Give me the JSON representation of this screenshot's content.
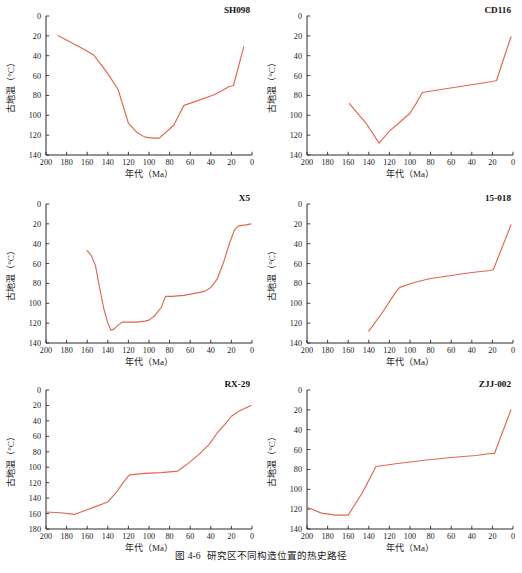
{
  "figure": {
    "caption_number": "图 4-6",
    "caption_text": "研究区不同构造位置的热史路径",
    "line_color": "#e2664f",
    "axis_color": "#2b2b2b"
  },
  "axes": {
    "xlabel": "年代（Ma）",
    "ylabel": "古地温（°C）",
    "x_ticks": [
      200,
      180,
      160,
      140,
      120,
      100,
      80,
      60,
      40,
      20,
      0
    ],
    "y_ticks_140": [
      0,
      20,
      40,
      60,
      80,
      100,
      120,
      140
    ],
    "y_ticks_180": [
      0,
      20,
      40,
      60,
      80,
      100,
      120,
      140,
      160,
      180
    ]
  },
  "chart_data": [
    {
      "type": "line",
      "title": "SH098",
      "xlabel": "年代（Ma）",
      "ylabel": "古地温（°C）",
      "xlim": [
        200,
        0
      ],
      "ylim": [
        140,
        0
      ],
      "y_inverted": true,
      "grid": false,
      "legend": "none",
      "series": [
        {
          "name": "SH098",
          "points": [
            [
              188,
              20
            ],
            [
              166,
              32
            ],
            [
              154,
              39
            ],
            [
              148,
              47
            ],
            [
              140,
              58
            ],
            [
              130,
              74
            ],
            [
              120,
              108
            ],
            [
              112,
              117
            ],
            [
              104,
              122
            ],
            [
              96,
              123
            ],
            [
              90,
              123
            ],
            [
              76,
              110
            ],
            [
              66,
              90
            ],
            [
              52,
              85
            ],
            [
              36,
              79
            ],
            [
              22,
              71
            ],
            [
              18,
              70
            ],
            [
              8,
              31
            ]
          ]
        }
      ]
    },
    {
      "type": "line",
      "title": "CD116",
      "xlabel": "年代（Ma）",
      "ylabel": "古地温（°C）",
      "xlim": [
        200,
        0
      ],
      "ylim": [
        140,
        0
      ],
      "y_inverted": true,
      "grid": false,
      "legend": "none",
      "series": [
        {
          "name": "CD116",
          "points": [
            [
              159,
              88
            ],
            [
              142,
              109
            ],
            [
              130,
              128
            ],
            [
              120,
              116
            ],
            [
              110,
              107
            ],
            [
              100,
              98
            ],
            [
              94,
              88
            ],
            [
              88,
              77
            ],
            [
              70,
              74
            ],
            [
              45,
              70
            ],
            [
              20,
              66
            ],
            [
              16,
              65
            ],
            [
              2,
              21
            ]
          ]
        }
      ]
    },
    {
      "type": "line",
      "title": "X5",
      "xlabel": "年代（Ma）",
      "ylabel": "古地温（°C）",
      "xlim": [
        200,
        0
      ],
      "ylim": [
        140,
        0
      ],
      "y_inverted": true,
      "grid": false,
      "legend": "none",
      "series": [
        {
          "name": "X5",
          "points": [
            [
              160,
              47
            ],
            [
              156,
              52
            ],
            [
              152,
              62
            ],
            [
              148,
              84
            ],
            [
              144,
              105
            ],
            [
              140,
              120
            ],
            [
              137,
              127
            ],
            [
              134,
              126
            ],
            [
              130,
              122
            ],
            [
              126,
              119
            ],
            [
              120,
              119
            ],
            [
              112,
              119
            ],
            [
              104,
              118
            ],
            [
              100,
              117
            ],
            [
              94,
              112
            ],
            [
              88,
              104
            ],
            [
              84,
              93
            ],
            [
              78,
              93
            ],
            [
              66,
              92
            ],
            [
              56,
              90
            ],
            [
              46,
              88
            ],
            [
              40,
              84
            ],
            [
              34,
              76
            ],
            [
              28,
              60
            ],
            [
              22,
              40
            ],
            [
              17,
              26
            ],
            [
              13,
              22
            ],
            [
              6,
              21
            ],
            [
              1,
              20
            ]
          ]
        }
      ]
    },
    {
      "type": "line",
      "title": "15-018",
      "xlabel": "年代（Ma）",
      "ylabel": "古地温（°C）",
      "xlim": [
        200,
        0
      ],
      "ylim": [
        140,
        0
      ],
      "y_inverted": true,
      "grid": false,
      "legend": "none",
      "series": [
        {
          "name": "15-018",
          "points": [
            [
              140,
              128
            ],
            [
              126,
              108
            ],
            [
              114,
              89
            ],
            [
              110,
              84
            ],
            [
              96,
              79
            ],
            [
              80,
              75
            ],
            [
              60,
              72
            ],
            [
              40,
              69
            ],
            [
              22,
              67
            ],
            [
              19,
              66
            ],
            [
              2,
              21
            ]
          ]
        }
      ]
    },
    {
      "type": "line",
      "title": "RX-29",
      "xlabel": "年代（Ma）",
      "ylabel": "古地温（°C）",
      "xlim": [
        200,
        0
      ],
      "ylim": [
        180,
        0
      ],
      "y_inverted": true,
      "grid": false,
      "legend": "none",
      "series": [
        {
          "name": "RX-29",
          "points": [
            [
              200,
              158
            ],
            [
              186,
              159
            ],
            [
              172,
              161
            ],
            [
              164,
              157
            ],
            [
              152,
              151
            ],
            [
              140,
              145
            ],
            [
              132,
              133
            ],
            [
              124,
              118
            ],
            [
              119,
              110
            ],
            [
              104,
              108
            ],
            [
              88,
              107
            ],
            [
              72,
              105
            ],
            [
              62,
              95
            ],
            [
              52,
              84
            ],
            [
              42,
              71
            ],
            [
              34,
              56
            ],
            [
              26,
              44
            ],
            [
              20,
              34
            ],
            [
              12,
              27
            ],
            [
              1,
              20
            ]
          ]
        }
      ]
    },
    {
      "type": "line",
      "title": "ZJJ-002",
      "xlabel": "年代（Ma）",
      "ylabel": "古地温（°C）",
      "xlim": [
        200,
        0
      ],
      "ylim": [
        140,
        0
      ],
      "y_inverted": true,
      "grid": false,
      "legend": "none",
      "series": [
        {
          "name": "ZJJ-002",
          "points": [
            [
              200,
              118
            ],
            [
              186,
              124
            ],
            [
              172,
              126
            ],
            [
              160,
              126
            ],
            [
              146,
              103
            ],
            [
              133,
              77
            ],
            [
              112,
              74
            ],
            [
              88,
              71
            ],
            [
              60,
              68
            ],
            [
              36,
              66
            ],
            [
              22,
              64
            ],
            [
              18,
              64
            ],
            [
              2,
              20
            ]
          ]
        }
      ]
    }
  ],
  "panels_layout": [
    {
      "name": "sh098",
      "left": 0,
      "top": 0
    },
    {
      "name": "cd116",
      "left": 261,
      "top": 0
    },
    {
      "name": "x5",
      "left": 0,
      "top": 188
    },
    {
      "name": "15-018",
      "left": 261,
      "top": 188
    },
    {
      "name": "rx-29",
      "left": 0,
      "top": 374
    },
    {
      "name": "zjj-002",
      "left": 261,
      "top": 374
    }
  ]
}
